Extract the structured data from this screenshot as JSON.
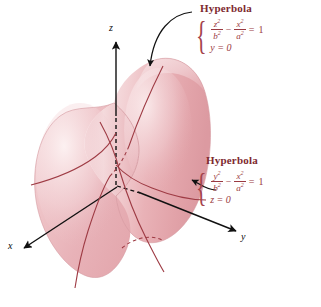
{
  "figure": {
    "kind": "hyperboloid-of-one-sheet",
    "background_color": "#ffffff",
    "surface": {
      "fill_light": "#f7e2e3",
      "fill_mid": "#eeb9bd",
      "fill_dark": "#dd9aa0",
      "edge_color": "#c07f85"
    },
    "trace_curve_color": "#9e3b44",
    "axis_color": "#111111",
    "annotation_color": "#8a2b33"
  },
  "axes": {
    "z": {
      "label": "z",
      "direction": "up"
    },
    "y": {
      "label": "y",
      "direction": "lower-right"
    },
    "x": {
      "label": "x",
      "direction": "lower-left"
    }
  },
  "annotations": {
    "top": {
      "title": "Hyperbola",
      "equation_line1": {
        "frac1_num": "z2",
        "frac1_num_base": "z",
        "frac1_num_exp": "2",
        "frac1_den_base": "b",
        "frac1_den_exp": "2",
        "operator": "−",
        "frac2_num_base": "x",
        "frac2_num_exp": "2",
        "frac2_den_base": "a",
        "frac2_den_exp": "2",
        "equals": "=",
        "rhs": "1"
      },
      "equation_line2": "y = 0",
      "brace": "{"
    },
    "bottom": {
      "title": "Hyperbola",
      "equation_line1": {
        "frac1_num_base": "y",
        "frac1_num_exp": "2",
        "frac1_den_base": "b",
        "frac1_den_exp": "2",
        "operator": "−",
        "frac2_num_base": "x",
        "frac2_num_exp": "2",
        "frac2_den_base": "a",
        "frac2_den_exp": "2",
        "equals": "=",
        "rhs": "1"
      },
      "equation_line2": "z = 0",
      "brace": "{"
    }
  }
}
